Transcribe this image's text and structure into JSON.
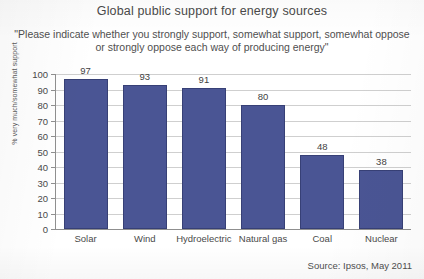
{
  "chart_data": {
    "type": "bar",
    "title": "Global public support for energy sources",
    "subtitle_line_1": "\"Please indicate whether you strongly support, somewhat support, somewhat oppose",
    "subtitle_line_2": "or strongly oppose each way of producing energy\"",
    "categories": [
      "Solar",
      "Wind",
      "Hydroelectric",
      "Natural gas",
      "Coal",
      "Nuclear"
    ],
    "values": [
      97,
      93,
      91,
      80,
      48,
      38
    ],
    "xlabel": "",
    "ylabel": "% very much/somewhat support",
    "ylim": [
      0,
      100
    ],
    "yticks": [
      100,
      90,
      80,
      70,
      60,
      50,
      40,
      30,
      20,
      10,
      0
    ],
    "grid": true,
    "legend": false,
    "bar_color": "#4a5594",
    "source": "Source: Ipsos, May 2011"
  }
}
